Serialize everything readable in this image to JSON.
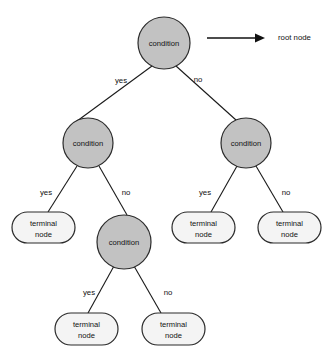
{
  "diagram": {
    "kind": "decision-tree",
    "background_color": "#ffffff",
    "condition_node_fill": "#c2c2c2",
    "terminal_node_fill": "#f4f4f4",
    "stroke_color": "#2b2b2b",
    "text_color": "#111111"
  },
  "annotation": {
    "label": "root node",
    "arrow": "right-arrow"
  },
  "labels": {
    "condition": "condition",
    "terminal_line1": "terminal",
    "terminal_line2": "node",
    "yes": "yes",
    "no": "no"
  },
  "nodes": {
    "root": {
      "label": "condition",
      "type": "condition",
      "cx": 164,
      "cy": 43,
      "r": 26
    },
    "level2_left": {
      "label": "condition",
      "type": "condition",
      "cx": 88,
      "cy": 143,
      "r": 25
    },
    "level2_right": {
      "label": "condition",
      "type": "condition",
      "cx": 246,
      "cy": 143,
      "r": 25
    },
    "level3_mid": {
      "label": "condition",
      "type": "condition",
      "cx": 124,
      "cy": 242,
      "r": 27
    },
    "terminal_a": {
      "line1": "terminal",
      "line2": "node",
      "type": "terminal",
      "x": 12,
      "y": 212,
      "w": 63,
      "h": 31
    },
    "terminal_b": {
      "line1": "terminal",
      "line2": "node",
      "type": "terminal",
      "x": 172,
      "y": 212,
      "w": 63,
      "h": 31
    },
    "terminal_c": {
      "line1": "terminal",
      "line2": "node",
      "type": "terminal",
      "x": 258,
      "y": 212,
      "w": 63,
      "h": 31
    },
    "terminal_d": {
      "line1": "terminal",
      "line2": "node",
      "type": "terminal",
      "x": 55,
      "y": 313,
      "w": 63,
      "h": 32
    },
    "terminal_e": {
      "line1": "terminal",
      "line2": "node",
      "type": "terminal",
      "x": 142,
      "y": 313,
      "w": 63,
      "h": 32
    }
  },
  "branches": [
    {
      "from": "root",
      "to": "level2_left",
      "label": "yes",
      "label_x": 121,
      "label_y": 81
    },
    {
      "from": "root",
      "to": "level2_right",
      "label": "no",
      "label_x": 198,
      "label_y": 80
    },
    {
      "from": "level2_left",
      "to": "terminal_a",
      "label": "yes",
      "label_x": 46,
      "label_y": 193
    },
    {
      "from": "level2_left",
      "to": "level3_mid",
      "label": "no",
      "label_x": 126,
      "label_y": 193
    },
    {
      "from": "level2_right",
      "to": "terminal_b",
      "label": "yes",
      "label_x": 205,
      "label_y": 193
    },
    {
      "from": "level2_right",
      "to": "terminal_c",
      "label": "no",
      "label_x": 286,
      "label_y": 193
    },
    {
      "from": "level3_mid",
      "to": "terminal_d",
      "label": "yes",
      "label_x": 89,
      "label_y": 293
    },
    {
      "from": "level3_mid",
      "to": "terminal_e",
      "label": "no",
      "label_x": 168,
      "label_y": 293
    }
  ]
}
